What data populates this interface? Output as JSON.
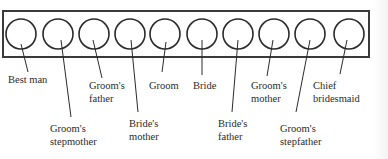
{
  "diagram": {
    "type": "seating-arrangement",
    "frame": {
      "x": 3,
      "y": 11,
      "width": 366,
      "height": 46,
      "stroke": "#3a3a3a"
    },
    "seat_style": {
      "r": 15,
      "cy": 34,
      "stroke": "#2a2a2a"
    },
    "seats": [
      {
        "cx": 21,
        "line": [
          21,
          44,
          28,
          72
        ],
        "label_lines": [
          "Best man"
        ],
        "label_pos": [
          8,
          73
        ]
      },
      {
        "cx": 58,
        "line": [
          61,
          40,
          71,
          117
        ],
        "label_lines": [
          "Groom's",
          "stepmother"
        ],
        "label_pos": [
          50,
          122
        ]
      },
      {
        "cx": 94,
        "line": [
          93,
          40,
          102,
          78
        ],
        "label_lines": [
          "Groom's",
          "father"
        ],
        "label_pos": [
          89,
          79
        ]
      },
      {
        "cx": 130,
        "line": [
          131,
          40,
          138,
          112
        ],
        "label_lines": [
          "Bride's",
          "mother"
        ],
        "label_pos": [
          129,
          117
        ]
      },
      {
        "cx": 165,
        "line": [
          166,
          42,
          162,
          72
        ],
        "label_lines": [
          "Groom"
        ],
        "label_pos": [
          149,
          79
        ]
      },
      {
        "cx": 202,
        "line": [
          202,
          40,
          202,
          75
        ],
        "label_lines": [
          "Bride"
        ],
        "label_pos": [
          193,
          79
        ]
      },
      {
        "cx": 238,
        "line": [
          238,
          40,
          232,
          112
        ],
        "label_lines": [
          "Bride's",
          "father"
        ],
        "label_pos": [
          218,
          117
        ]
      },
      {
        "cx": 274,
        "line": [
          273,
          40,
          267,
          76
        ],
        "label_lines": [
          "Groom's",
          "mother"
        ],
        "label_pos": [
          251,
          79
        ]
      },
      {
        "cx": 310,
        "line": [
          310,
          40,
          296,
          112
        ],
        "label_lines": [
          "Groom's",
          "stepfather"
        ],
        "label_pos": [
          280,
          122
        ]
      },
      {
        "cx": 349,
        "line": [
          347,
          40,
          340,
          74
        ],
        "label_lines": [
          "Chief",
          "bridesmaid"
        ],
        "label_pos": [
          313,
          79
        ]
      }
    ]
  },
  "labels": {
    "best_man": "Best man",
    "grooms_stepmother": "Groom's stepmother",
    "grooms_father": "Groom's father",
    "brides_mother": "Bride's mother",
    "groom": "Groom",
    "bride": "Bride",
    "brides_father": "Bride's father",
    "grooms_mother": "Groom's mother",
    "grooms_stepfather": "Groom's stepfather",
    "chief_bridesmaid": "Chief bridesmaid"
  }
}
